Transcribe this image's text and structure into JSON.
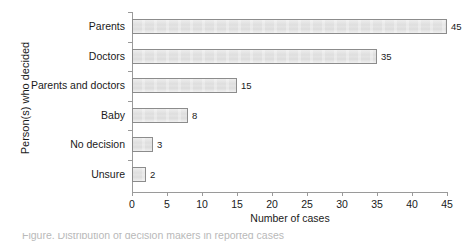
{
  "chart_data": {
    "type": "bar",
    "orientation": "horizontal",
    "title": "",
    "xlabel": "Number of cases",
    "ylabel": "Person(s) who decided",
    "categories": [
      "Parents",
      "Doctors",
      "Parents and doctors",
      "Baby",
      "No decision",
      "Unsure"
    ],
    "values": [
      45,
      35,
      15,
      8,
      3,
      2
    ],
    "value_labels": [
      "45",
      "35",
      "15",
      "8",
      "3",
      "2"
    ],
    "xlim": [
      0,
      45
    ],
    "xticks": [
      0,
      5,
      10,
      15,
      20,
      25,
      30,
      35,
      40,
      45
    ],
    "xticklabels": [
      "0",
      "5",
      "10",
      "15",
      "20",
      "25",
      "30",
      "35",
      "40",
      "45"
    ],
    "grid": false,
    "legend": false,
    "bar_fill_color": "#e3e3e3",
    "bar_border_color": "#8c8c8c",
    "axis_color": "#9a9a9a",
    "text_color": "#1a1a1a"
  },
  "caption": {
    "clipped_text": "Figure. Distribution of decision makers in reported cases"
  }
}
